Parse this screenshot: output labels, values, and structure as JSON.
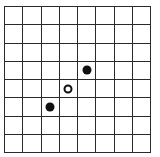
{
  "board": {
    "rows": 8,
    "cols": 8,
    "line_color": "#2a2a2a",
    "background": "#ffffff",
    "pieces": [
      {
        "row": 3,
        "col": 4,
        "color": "black",
        "fill": "#111111"
      },
      {
        "row": 4,
        "col": 3,
        "color": "white",
        "fill": "#ffffff"
      },
      {
        "row": 5,
        "col": 2,
        "color": "black",
        "fill": "#111111"
      }
    ]
  }
}
